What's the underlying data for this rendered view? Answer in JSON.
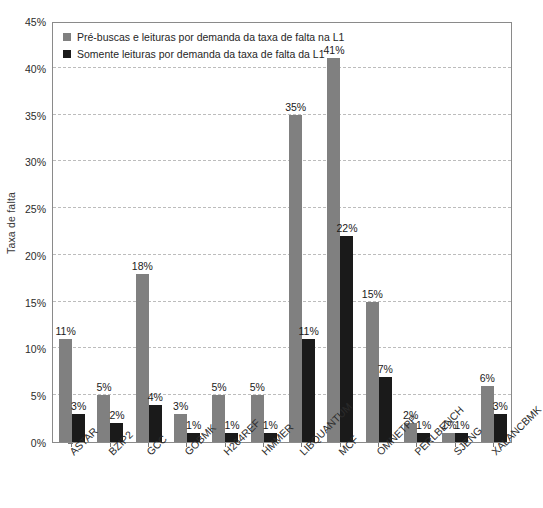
{
  "chart_data": {
    "type": "bar",
    "title": "",
    "xlabel": "",
    "ylabel": "Taxa de falta",
    "ylim": [
      0,
      45
    ],
    "ytick_labels": [
      "0%",
      "5%",
      "10%",
      "15%",
      "20%",
      "25%",
      "30%",
      "35%",
      "40%",
      "45%"
    ],
    "ytick_values": [
      0,
      5,
      10,
      15,
      20,
      25,
      30,
      35,
      40,
      45
    ],
    "grid": true,
    "legend_position": "top-left",
    "categories": [
      "ASTAR",
      "BZIP2",
      "GCC",
      "GOBMK",
      "H264REF",
      "HMMER",
      "LIBQUANTUM",
      "MCF",
      "OMNETPP",
      "PERLBENCH",
      "SJENG",
      "XALANCBMK"
    ],
    "series": [
      {
        "name": "Pré-buscas e leituras por demanda da taxa de falta na L1",
        "color": "#808080",
        "values": [
          11,
          5,
          18,
          3,
          5,
          5,
          35,
          41,
          15,
          2,
          1,
          6
        ],
        "labels": [
          "11%",
          "5%",
          "18%",
          "3%",
          "5%",
          "5%",
          "35%",
          "41%",
          "15%",
          "2%",
          "1%",
          "6%"
        ]
      },
      {
        "name": "Somente leituras por demanda da taxa de falta da L1",
        "color": "#1a1a1a",
        "values": [
          3,
          2,
          4,
          1,
          1,
          1,
          11,
          22,
          7,
          1,
          1,
          3
        ],
        "labels": [
          "3%",
          "2%",
          "4%",
          "1%",
          "1%",
          "1%",
          "11%",
          "22%",
          "7%",
          "1%",
          "1%",
          "3%"
        ]
      }
    ]
  },
  "legend": {
    "items": [
      {
        "label": "Pré-buscas e leituras por demanda da taxa de falta na L1",
        "color": "#808080"
      },
      {
        "label": "Somente leituras por demanda da taxa de falta da L1",
        "color": "#1a1a1a"
      }
    ]
  },
  "axes": {
    "y_title": "Taxa de falta"
  }
}
